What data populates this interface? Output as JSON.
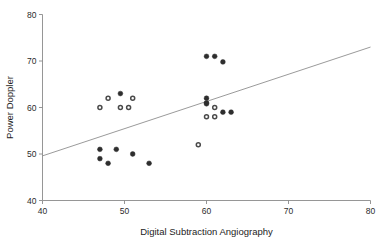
{
  "chart_data": {
    "type": "scatter",
    "title": "",
    "xlabel": "Digital Subtraction Angiography",
    "ylabel": "Power Doppler",
    "xlim": [
      40,
      80
    ],
    "ylim": [
      40,
      80
    ],
    "xticks": [
      40,
      50,
      60,
      70,
      80
    ],
    "yticks": [
      40,
      50,
      60,
      70,
      80
    ],
    "xtick_labels": [
      "40",
      "50",
      "60",
      "70",
      "80"
    ],
    "ytick_labels": [
      "40",
      "50",
      "60",
      "70",
      "80"
    ],
    "grid": false,
    "legend": null,
    "legend_position": "none",
    "marker": "circle",
    "marker_color": "#2e2e2e",
    "series": [
      {
        "name": "Measurements",
        "points": [
          {
            "x": 47.0,
            "y": 51.0,
            "style": "filled"
          },
          {
            "x": 47.0,
            "y": 49.0,
            "style": "filled"
          },
          {
            "x": 48.0,
            "y": 48.0,
            "style": "filled"
          },
          {
            "x": 49.0,
            "y": 51.0,
            "style": "filled"
          },
          {
            "x": 51.0,
            "y": 50.0,
            "style": "filled"
          },
          {
            "x": 53.0,
            "y": 48.0,
            "style": "filled"
          },
          {
            "x": 47.0,
            "y": 60.0,
            "style": "open"
          },
          {
            "x": 48.0,
            "y": 62.0,
            "style": "open"
          },
          {
            "x": 49.5,
            "y": 63.0,
            "style": "filled"
          },
          {
            "x": 49.5,
            "y": 60.0,
            "style": "open"
          },
          {
            "x": 50.5,
            "y": 60.0,
            "style": "open"
          },
          {
            "x": 51.0,
            "y": 62.0,
            "style": "open"
          },
          {
            "x": 59.0,
            "y": 52.0,
            "style": "open"
          },
          {
            "x": 60.0,
            "y": 62.0,
            "style": "filled"
          },
          {
            "x": 60.0,
            "y": 61.0,
            "style": "filled"
          },
          {
            "x": 60.0,
            "y": 60.8,
            "style": "filled"
          },
          {
            "x": 60.0,
            "y": 58.0,
            "style": "open"
          },
          {
            "x": 60.0,
            "y": 71.0,
            "style": "filled"
          },
          {
            "x": 61.0,
            "y": 71.0,
            "style": "filled"
          },
          {
            "x": 61.0,
            "y": 60.0,
            "style": "open"
          },
          {
            "x": 61.0,
            "y": 58.0,
            "style": "open"
          },
          {
            "x": 62.0,
            "y": 69.8,
            "style": "filled"
          },
          {
            "x": 62.0,
            "y": 59.0,
            "style": "filled"
          },
          {
            "x": 63.0,
            "y": 59.0,
            "style": "filled"
          }
        ]
      }
    ],
    "fit_line": {
      "name": "regression-line",
      "x0": 40.0,
      "y0": 49.6,
      "x1": 80.0,
      "y1": 73.0,
      "color": "#8f8f8f"
    }
  }
}
